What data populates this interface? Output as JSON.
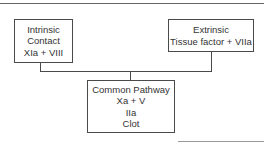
{
  "diagram": {
    "nodes": {
      "intrinsic": {
        "lines": [
          "Intrinsic",
          "Contact",
          "XIa + VIII"
        ]
      },
      "extrinsic": {
        "lines": [
          "Extrinsic",
          "Tissue factor + VIIa"
        ]
      },
      "common": {
        "lines": [
          "Common Pathway",
          "Xa + V",
          "IIa",
          "Clot"
        ]
      }
    },
    "edges": [
      {
        "from": "intrinsic",
        "to": "common"
      },
      {
        "from": "extrinsic",
        "to": "common"
      }
    ]
  }
}
